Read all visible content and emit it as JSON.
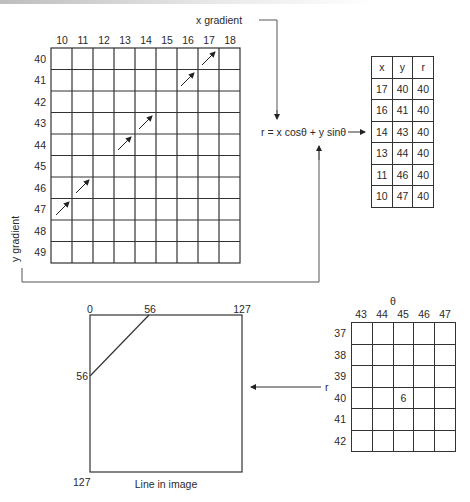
{
  "gradient_grid": {
    "x_label": "x gradient",
    "y_label": "y gradient",
    "columns": [
      "10",
      "11",
      "12",
      "13",
      "14",
      "15",
      "16",
      "17",
      "18"
    ],
    "rows": [
      "40",
      "41",
      "42",
      "43",
      "44",
      "45",
      "46",
      "47",
      "48",
      "49"
    ],
    "arrow_cells": [
      {
        "x": "17",
        "y": "40"
      },
      {
        "x": "16",
        "y": "41"
      },
      {
        "x": "14",
        "y": "43"
      },
      {
        "x": "13",
        "y": "44"
      },
      {
        "x": "11",
        "y": "46"
      },
      {
        "x": "10",
        "y": "47"
      }
    ]
  },
  "formula": {
    "text": "r = x cosθ + y sinθ"
  },
  "result_table": {
    "headers": [
      "x",
      "y",
      "r"
    ],
    "rows": [
      [
        "17",
        "40",
        "40"
      ],
      [
        "16",
        "41",
        "40"
      ],
      [
        "14",
        "43",
        "40"
      ],
      [
        "13",
        "44",
        "40"
      ],
      [
        "11",
        "46",
        "40"
      ],
      [
        "10",
        "47",
        "40"
      ]
    ]
  },
  "accumulator": {
    "theta_label": "θ",
    "r_label": "r",
    "columns": [
      "43",
      "44",
      "45",
      "46",
      "47"
    ],
    "rows": [
      "37",
      "38",
      "39",
      "40",
      "41",
      "42"
    ],
    "cells": [
      [
        "",
        "",
        "",
        "",
        ""
      ],
      [
        "",
        "",
        "",
        "",
        ""
      ],
      [
        "",
        "",
        "",
        "",
        ""
      ],
      [
        "",
        "",
        "6",
        "",
        ""
      ],
      [
        "",
        "",
        "",
        "",
        ""
      ],
      [
        "",
        "",
        "",
        "",
        ""
      ]
    ]
  },
  "image_box": {
    "top_left_label": "0",
    "top_mid_label": "56",
    "top_right_label": "127",
    "left_mid_label": "56",
    "bottom_left_label": "127",
    "caption": "Line in image"
  },
  "colors": {
    "line": "#333333",
    "connector": "#555555"
  }
}
